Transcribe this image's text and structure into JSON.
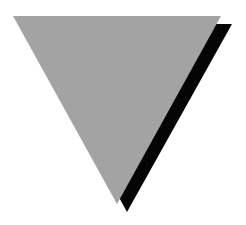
{
  "canvas": {
    "width": 246,
    "height": 225,
    "background": "#ffffff"
  },
  "shapes": {
    "shadow_triangle": {
      "name": "inverted-triangle-shadow",
      "color": "#050505",
      "points": "24,24 232,24 127,212"
    },
    "main_triangle": {
      "name": "inverted-triangle",
      "color": "#a3a3a3",
      "points": "13,16 221,16 117,204"
    }
  }
}
